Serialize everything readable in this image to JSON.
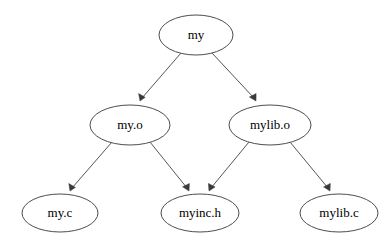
{
  "diagram": {
    "type": "directed-graph",
    "background_color": "#ffffff",
    "node_fill_color": "#ffffff",
    "node_stroke_color": "#4d4d4d",
    "edge_color": "#555555",
    "arrowhead_color": "#3a3a3a",
    "label_color": "#000000",
    "nodes": [
      {
        "id": "my",
        "label": "my",
        "cx": 196,
        "cy": 35,
        "rx": 37,
        "ry": 20,
        "row": 0
      },
      {
        "id": "my_o",
        "label": "my.o",
        "cx": 130,
        "cy": 125,
        "rx": 40,
        "ry": 20,
        "row": 1
      },
      {
        "id": "mylib_o",
        "label": "mylib.o",
        "cx": 270,
        "cy": 125,
        "rx": 41,
        "ry": 20,
        "row": 1
      },
      {
        "id": "my_c",
        "label": "my.c",
        "cx": 60,
        "cy": 213,
        "rx": 38,
        "ry": 19,
        "row": 2
      },
      {
        "id": "myinc_h",
        "label": "myinc.h",
        "cx": 200,
        "cy": 213,
        "rx": 39,
        "ry": 19,
        "row": 2
      },
      {
        "id": "mylib_c",
        "label": "mylib.c",
        "cx": 339,
        "cy": 213,
        "rx": 39,
        "ry": 19,
        "row": 2
      }
    ],
    "edges": [
      {
        "id": "edge-my-to-my-o",
        "from": "my",
        "to": "my_o",
        "x1": 181,
        "y1": 53,
        "x2": 140,
        "y2": 101
      },
      {
        "id": "edge-my-to-mylib-o",
        "from": "my",
        "to": "mylib_o",
        "x1": 212,
        "y1": 53,
        "x2": 256,
        "y2": 101
      },
      {
        "id": "edge-my-o-to-my-c",
        "from": "my_o",
        "to": "my_c",
        "x1": 112,
        "y1": 142,
        "x2": 70,
        "y2": 191
      },
      {
        "id": "edge-my-o-to-myinc-h",
        "from": "my_o",
        "to": "myinc_h",
        "x1": 150,
        "y1": 142,
        "x2": 189,
        "y2": 191
      },
      {
        "id": "edge-mylib-o-to-myinc-h",
        "from": "mylib_o",
        "to": "myinc_h",
        "x1": 249,
        "y1": 142,
        "x2": 209,
        "y2": 191
      },
      {
        "id": "edge-mylib-o-to-mylib-c",
        "from": "mylib_o",
        "to": "mylib_c",
        "x1": 290,
        "y1": 142,
        "x2": 330,
        "y2": 191
      }
    ]
  }
}
